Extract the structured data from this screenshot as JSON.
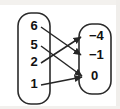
{
  "diagram": {
    "type": "mapping-diagram",
    "title": "",
    "domain": {
      "name": "input-set",
      "values": [
        "6",
        "5",
        "2",
        "1"
      ]
    },
    "range": {
      "name": "output-set",
      "values": [
        "−4",
        "−1",
        "0"
      ]
    },
    "mappings": [
      {
        "from": "6",
        "to": "−1"
      },
      {
        "from": "5",
        "to": "0"
      },
      {
        "from": "2",
        "to": "−4"
      },
      {
        "from": "1",
        "to": "0"
      }
    ],
    "colors": {
      "outline": "#2b2b2b",
      "arrow": "#262626",
      "text": "#111111",
      "background": "#ffffff"
    }
  }
}
